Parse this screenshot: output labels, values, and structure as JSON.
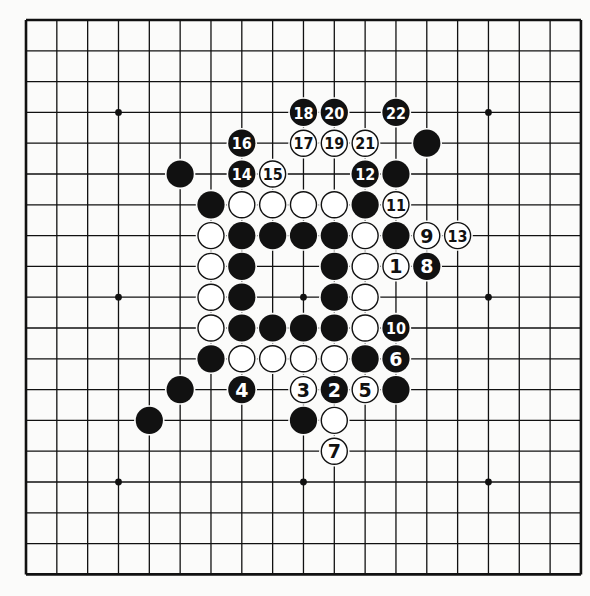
{
  "board": {
    "size": 19,
    "origin_x": 26,
    "origin_y": 20,
    "spacing_x": 30.83,
    "spacing_y": 30.8,
    "colors": {
      "black": "#111111",
      "white": "#ffffff",
      "line": "#111111",
      "background": "#fbfbfa"
    },
    "star_points": [
      [
        3,
        3
      ],
      [
        9,
        3
      ],
      [
        15,
        3
      ],
      [
        3,
        9
      ],
      [
        9,
        9
      ],
      [
        15,
        9
      ],
      [
        3,
        15
      ],
      [
        9,
        15
      ],
      [
        15,
        15
      ]
    ],
    "stones": [
      {
        "col": 9,
        "row": 3,
        "color": "black",
        "label": "18"
      },
      {
        "col": 10,
        "row": 3,
        "color": "black",
        "label": "20"
      },
      {
        "col": 12,
        "row": 3,
        "color": "black",
        "label": "22"
      },
      {
        "col": 7,
        "row": 4,
        "color": "black",
        "label": "16"
      },
      {
        "col": 9,
        "row": 4,
        "color": "white",
        "label": "17"
      },
      {
        "col": 10,
        "row": 4,
        "color": "white",
        "label": "19"
      },
      {
        "col": 11,
        "row": 4,
        "color": "white",
        "label": "21"
      },
      {
        "col": 13,
        "row": 4,
        "color": "black",
        "label": ""
      },
      {
        "col": 5,
        "row": 5,
        "color": "black",
        "label": ""
      },
      {
        "col": 7,
        "row": 5,
        "color": "black",
        "label": "14"
      },
      {
        "col": 8,
        "row": 5,
        "color": "white",
        "label": "15"
      },
      {
        "col": 11,
        "row": 5,
        "color": "black",
        "label": "12"
      },
      {
        "col": 12,
        "row": 5,
        "color": "black",
        "label": ""
      },
      {
        "col": 6,
        "row": 6,
        "color": "black",
        "label": ""
      },
      {
        "col": 7,
        "row": 6,
        "color": "white",
        "label": ""
      },
      {
        "col": 8,
        "row": 6,
        "color": "white",
        "label": ""
      },
      {
        "col": 9,
        "row": 6,
        "color": "white",
        "label": ""
      },
      {
        "col": 10,
        "row": 6,
        "color": "white",
        "label": ""
      },
      {
        "col": 11,
        "row": 6,
        "color": "black",
        "label": ""
      },
      {
        "col": 12,
        "row": 6,
        "color": "white",
        "label": "11"
      },
      {
        "col": 6,
        "row": 7,
        "color": "white",
        "label": ""
      },
      {
        "col": 7,
        "row": 7,
        "color": "black",
        "label": ""
      },
      {
        "col": 8,
        "row": 7,
        "color": "black",
        "label": ""
      },
      {
        "col": 9,
        "row": 7,
        "color": "black",
        "label": ""
      },
      {
        "col": 10,
        "row": 7,
        "color": "black",
        "label": ""
      },
      {
        "col": 11,
        "row": 7,
        "color": "white",
        "label": ""
      },
      {
        "col": 12,
        "row": 7,
        "color": "black",
        "label": ""
      },
      {
        "col": 13,
        "row": 7,
        "color": "white",
        "label": "9"
      },
      {
        "col": 14,
        "row": 7,
        "color": "white",
        "label": "13"
      },
      {
        "col": 6,
        "row": 8,
        "color": "white",
        "label": ""
      },
      {
        "col": 7,
        "row": 8,
        "color": "black",
        "label": ""
      },
      {
        "col": 10,
        "row": 8,
        "color": "black",
        "label": ""
      },
      {
        "col": 11,
        "row": 8,
        "color": "white",
        "label": ""
      },
      {
        "col": 12,
        "row": 8,
        "color": "white",
        "label": "1"
      },
      {
        "col": 13,
        "row": 8,
        "color": "black",
        "label": "8"
      },
      {
        "col": 6,
        "row": 9,
        "color": "white",
        "label": ""
      },
      {
        "col": 7,
        "row": 9,
        "color": "black",
        "label": ""
      },
      {
        "col": 10,
        "row": 9,
        "color": "black",
        "label": ""
      },
      {
        "col": 11,
        "row": 9,
        "color": "white",
        "label": ""
      },
      {
        "col": 6,
        "row": 10,
        "color": "white",
        "label": ""
      },
      {
        "col": 7,
        "row": 10,
        "color": "black",
        "label": ""
      },
      {
        "col": 8,
        "row": 10,
        "color": "black",
        "label": ""
      },
      {
        "col": 9,
        "row": 10,
        "color": "black",
        "label": ""
      },
      {
        "col": 10,
        "row": 10,
        "color": "black",
        "label": ""
      },
      {
        "col": 11,
        "row": 10,
        "color": "white",
        "label": ""
      },
      {
        "col": 12,
        "row": 10,
        "color": "black",
        "label": "10"
      },
      {
        "col": 6,
        "row": 11,
        "color": "black",
        "label": ""
      },
      {
        "col": 7,
        "row": 11,
        "color": "white",
        "label": ""
      },
      {
        "col": 8,
        "row": 11,
        "color": "white",
        "label": ""
      },
      {
        "col": 9,
        "row": 11,
        "color": "white",
        "label": ""
      },
      {
        "col": 10,
        "row": 11,
        "color": "white",
        "label": ""
      },
      {
        "col": 11,
        "row": 11,
        "color": "black",
        "label": ""
      },
      {
        "col": 12,
        "row": 11,
        "color": "black",
        "label": "6"
      },
      {
        "col": 5,
        "row": 12,
        "color": "black",
        "label": ""
      },
      {
        "col": 7,
        "row": 12,
        "color": "black",
        "label": "4"
      },
      {
        "col": 9,
        "row": 12,
        "color": "white",
        "label": "3"
      },
      {
        "col": 10,
        "row": 12,
        "color": "black",
        "label": "2"
      },
      {
        "col": 11,
        "row": 12,
        "color": "white",
        "label": "5"
      },
      {
        "col": 12,
        "row": 12,
        "color": "black",
        "label": ""
      },
      {
        "col": 4,
        "row": 13,
        "color": "black",
        "label": ""
      },
      {
        "col": 9,
        "row": 13,
        "color": "black",
        "label": ""
      },
      {
        "col": 10,
        "row": 13,
        "color": "white",
        "label": ""
      },
      {
        "col": 10,
        "row": 14,
        "color": "white",
        "label": "7"
      }
    ]
  }
}
